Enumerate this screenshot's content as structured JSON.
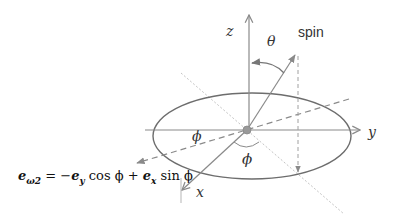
{
  "diagram": {
    "colors": {
      "axis": "#8a8a8a",
      "ellipse": "#6d6d6d",
      "dashed": "#8a8a8a",
      "dotted": "#bfbfbf",
      "center_dot": "#999999",
      "text": "#333333"
    },
    "labels": {
      "z_axis": "z",
      "y_axis": "y",
      "x_axis": "x",
      "theta": "θ",
      "spin": "spin",
      "phi_left": "ϕ",
      "phi_bottom": "ϕ"
    },
    "equation": {
      "lhs_symbol": "e",
      "lhs_subscript": "ω2",
      "equals": " = −",
      "term1_symbol": "e",
      "term1_subscript": "y",
      "term1_func": " cos ϕ + ",
      "term2_symbol": "e",
      "term2_subscript": "x",
      "term2_func": " sin ϕ"
    }
  }
}
